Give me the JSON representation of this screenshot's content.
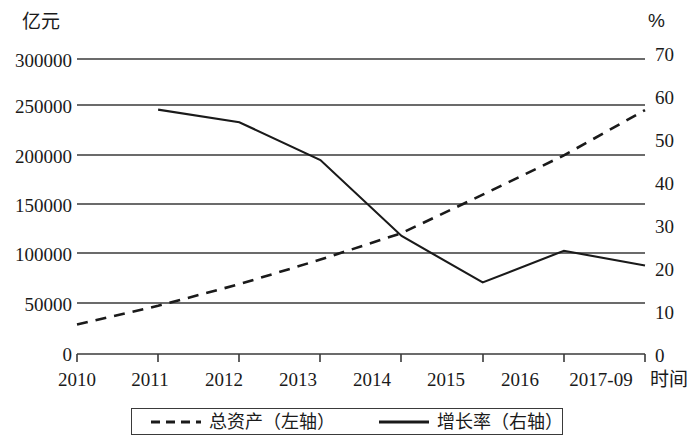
{
  "axes": {
    "left_unit": "亿元",
    "right_unit": "%",
    "x_title": "时间",
    "left_ticks": [
      "300000",
      "250000",
      "200000",
      "150000",
      "100000",
      "50000",
      "0"
    ],
    "right_ticks": [
      "70",
      "60",
      "50",
      "40",
      "30",
      "20",
      "10",
      "0"
    ],
    "x_ticks": [
      "2010",
      "2011",
      "2012",
      "2013",
      "2014",
      "2015",
      "2016",
      "2017-09"
    ]
  },
  "legend": {
    "assets_label": "总资产（左轴）",
    "growth_label": "增长率（右轴）"
  },
  "colors": {
    "line": "#1a1a1a",
    "grid": "#3a3a3a",
    "background": "#ffffff"
  },
  "chart_data": {
    "type": "line",
    "title": "",
    "subtitle": "",
    "xlabel": "时间",
    "ylabel": "亿元",
    "y2label": "%",
    "categories": [
      "2010",
      "2011",
      "2012",
      "2013",
      "2014",
      "2015",
      "2016",
      "2017-09"
    ],
    "ylim": [
      0,
      300000
    ],
    "y2lim": [
      0,
      70
    ],
    "grid": true,
    "legend_position": "bottom",
    "series": [
      {
        "name": "总资产（左轴）",
        "axis": "left",
        "style": "dashed",
        "x": [
          "2010",
          "2011",
          "2012",
          "2013",
          "2014",
          "2015",
          "2016",
          "2017-09"
        ],
        "values": [
          30000,
          49000,
          71000,
          96000,
          123000,
          162000,
          202000,
          248000
        ]
      },
      {
        "name": "增长率（右轴）",
        "axis": "right",
        "style": "solid",
        "x": [
          "2011",
          "2012",
          "2013",
          "2014",
          "2015",
          "2016",
          "2017-09"
        ],
        "values": [
          58.0,
          55.0,
          46.0,
          28.0,
          17.0,
          24.5,
          21.0
        ]
      }
    ],
    "annotations": []
  }
}
